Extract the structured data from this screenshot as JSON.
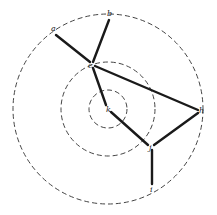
{
  "diagram": {
    "type": "concentric-graph",
    "center": {
      "x": 108,
      "y": 109
    },
    "rings": [
      {
        "name": "inner-ring",
        "r": 19
      },
      {
        "name": "middle-ring",
        "r": 47
      },
      {
        "name": "outer-ring",
        "r": 95
      }
    ],
    "nodes": [
      {
        "id": "a",
        "label": "a",
        "x": 55,
        "y": 32,
        "lx": 51,
        "ly": 31
      },
      {
        "id": "b",
        "label": "b",
        "x": 109,
        "y": 19,
        "lx": 107,
        "ly": 16
      },
      {
        "id": "c",
        "label": "c",
        "x": 92,
        "y": 65,
        "lx": 88,
        "ly": 68
      },
      {
        "id": "k",
        "label": "k",
        "x": 108,
        "y": 109,
        "lx": 106,
        "ly": 112
      },
      {
        "id": "h",
        "label": "h",
        "x": 200,
        "y": 110,
        "lx": 199,
        "ly": 113
      },
      {
        "id": "j",
        "label": "j",
        "x": 151,
        "y": 146,
        "lx": 149,
        "ly": 150
      },
      {
        "id": "i",
        "label": "i",
        "x": 152,
        "y": 185,
        "lx": 150,
        "ly": 192
      }
    ],
    "edges": [
      {
        "from": "a",
        "to": "c",
        "x1": 56,
        "y1": 35,
        "x2": 90,
        "y2": 62
      },
      {
        "from": "b",
        "to": "c",
        "x1": 109,
        "y1": 20,
        "x2": 93,
        "y2": 62
      },
      {
        "from": "c",
        "to": "k",
        "x1": 93,
        "y1": 68,
        "x2": 106,
        "y2": 105
      },
      {
        "from": "c",
        "to": "h",
        "x1": 95,
        "y1": 66,
        "x2": 198,
        "y2": 110
      },
      {
        "from": "k",
        "to": "j",
        "x1": 111,
        "y1": 112,
        "x2": 148,
        "y2": 145
      },
      {
        "from": "h",
        "to": "j",
        "x1": 198,
        "y1": 113,
        "x2": 154,
        "y2": 145
      },
      {
        "from": "j",
        "to": "i",
        "x1": 152,
        "y1": 150,
        "x2": 152,
        "y2": 184
      }
    ]
  }
}
